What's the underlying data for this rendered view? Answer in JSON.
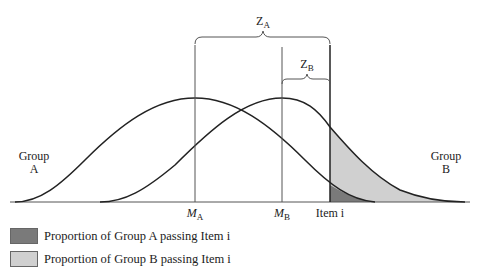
{
  "labels": {
    "group_a": [
      "Group",
      "A"
    ],
    "group_b": [
      "Group",
      "B"
    ],
    "z_a": {
      "main": "Z",
      "sub": "A"
    },
    "z_b": {
      "main": "Z",
      "sub": "B"
    },
    "m_a": {
      "main": "M",
      "sub": "A"
    },
    "m_b": {
      "main": "M",
      "sub": "B"
    },
    "item": "Item i"
  },
  "legend": [
    {
      "label": "Proportion of Group A passing Item i",
      "color": "#7a7a7a"
    },
    {
      "label": "Proportion of Group B passing Item i",
      "color": "#d0d0d0"
    }
  ],
  "colors": {
    "line": "#222222",
    "dark_fill": "#7a7a7a",
    "light_fill": "#d0d0d0"
  }
}
